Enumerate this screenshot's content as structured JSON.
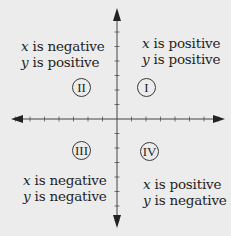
{
  "diagram": {
    "colors": {
      "background": "#ececec",
      "axis": "#444444",
      "text": "#1e1e1e"
    },
    "quadrants": [
      {
        "numeral": "I",
        "x_label_var": "x",
        "x_label_rest": " is positive",
        "y_label_var": "y",
        "y_label_rest": " is positive"
      },
      {
        "numeral": "II",
        "x_label_var": "x",
        "x_label_rest": " is negative",
        "y_label_var": "y",
        "y_label_rest": " is positive"
      },
      {
        "numeral": "III",
        "x_label_var": "x",
        "x_label_rest": " is negative",
        "y_label_var": "y",
        "y_label_rest": " is negative"
      },
      {
        "numeral": "IV",
        "x_label_var": "x",
        "x_label_rest": " is positive",
        "y_label_var": "y",
        "y_label_rest": " is negative"
      }
    ],
    "axes": {
      "origin": [
        117,
        119
      ],
      "x_range_px": [
        11,
        225
      ],
      "y_range_px": [
        8,
        228
      ],
      "tick_spacing_px": 14.5,
      "ticks_per_side": 7
    }
  }
}
